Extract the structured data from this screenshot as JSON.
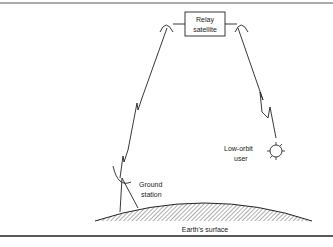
{
  "diagram": {
    "nodes": {
      "relay_satellite": {
        "label_line1": "Relay",
        "label_line2": "satellite"
      },
      "low_orbit_user": {
        "label_line1": "Low-orbit",
        "label_line2": "user"
      },
      "ground_station": {
        "label_line1": "Ground",
        "label_line2": "station"
      },
      "earth": {
        "label": "Earth's surface"
      }
    },
    "links": [
      {
        "from": "ground_station",
        "to": "relay_satellite"
      },
      {
        "from": "relay_satellite",
        "to": "low_orbit_user"
      }
    ],
    "colors": {
      "stroke": "#222222",
      "background": "#ffffff"
    }
  }
}
